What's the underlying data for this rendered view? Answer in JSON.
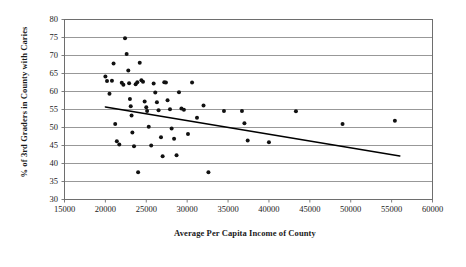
{
  "chart_data": {
    "type": "scatter",
    "title": "",
    "xlabel": "Average Per Capita Income of County",
    "ylabel": "% of 3rd Graders in County with Caries",
    "xlim": [
      15000,
      60000
    ],
    "ylim": [
      30,
      80
    ],
    "xticks": [
      15000,
      20000,
      25000,
      30000,
      35000,
      40000,
      45000,
      50000,
      55000,
      60000
    ],
    "yticks": [
      30,
      35,
      40,
      45,
      50,
      55,
      60,
      65,
      70,
      75,
      80
    ],
    "grid": "horizontal",
    "legend": "none",
    "marker_color": "#111111",
    "trendline_color": "#000000",
    "gridline_color": "#8c8c8c",
    "frame_color": "#6e6e6e",
    "points": [
      [
        20000,
        64.2
      ],
      [
        20200,
        62.9
      ],
      [
        20500,
        59.4
      ],
      [
        20800,
        63.0
      ],
      [
        21000,
        67.8
      ],
      [
        21200,
        51.0
      ],
      [
        21400,
        46.2
      ],
      [
        21700,
        45.3
      ],
      [
        22000,
        62.4
      ],
      [
        22200,
        61.9
      ],
      [
        22400,
        74.8
      ],
      [
        22600,
        70.4
      ],
      [
        22800,
        65.8
      ],
      [
        22900,
        62.3
      ],
      [
        23000,
        57.9
      ],
      [
        23100,
        55.9
      ],
      [
        23200,
        53.3
      ],
      [
        23300,
        48.6
      ],
      [
        23500,
        44.8
      ],
      [
        23700,
        62.0
      ],
      [
        23900,
        62.6
      ],
      [
        24000,
        37.6
      ],
      [
        24200,
        68.0
      ],
      [
        24400,
        63.1
      ],
      [
        24600,
        62.7
      ],
      [
        24800,
        57.2
      ],
      [
        25000,
        55.6
      ],
      [
        25100,
        54.6
      ],
      [
        25300,
        50.2
      ],
      [
        25600,
        45.0
      ],
      [
        25900,
        62.2
      ],
      [
        26100,
        59.7
      ],
      [
        26300,
        57.0
      ],
      [
        26500,
        54.8
      ],
      [
        26800,
        47.3
      ],
      [
        27000,
        42.0
      ],
      [
        27200,
        62.6
      ],
      [
        27400,
        62.5
      ],
      [
        27600,
        57.6
      ],
      [
        27900,
        55.1
      ],
      [
        28100,
        49.7
      ],
      [
        28400,
        46.9
      ],
      [
        28700,
        42.3
      ],
      [
        29000,
        59.8
      ],
      [
        29300,
        55.3
      ],
      [
        29600,
        54.9
      ],
      [
        30100,
        48.2
      ],
      [
        30600,
        62.5
      ],
      [
        31200,
        52.7
      ],
      [
        32000,
        56.1
      ],
      [
        32600,
        37.6
      ],
      [
        34500,
        54.6
      ],
      [
        36700,
        54.6
      ],
      [
        37000,
        51.2
      ],
      [
        37400,
        46.4
      ],
      [
        40000,
        45.9
      ],
      [
        43300,
        54.5
      ],
      [
        49000,
        51.0
      ],
      [
        55400,
        51.9
      ]
    ],
    "trendline": {
      "x_start": 20000,
      "y_start": 55.7,
      "x_end": 56000,
      "y_end": 42.1
    }
  }
}
